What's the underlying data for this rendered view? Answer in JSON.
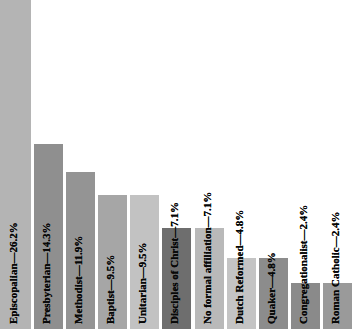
{
  "figure": {
    "background_color": "#ffffff",
    "label_color": "#080808"
  },
  "chart_data": {
    "type": "bar",
    "title": "",
    "subtitle": "",
    "xlabel": "",
    "ylabel": "",
    "grid": false,
    "legend": "none",
    "orientation": "vertical",
    "value_unit": "%",
    "ylim": [
      0,
      28
    ],
    "note": "Bar labels are rotated 90 degrees and drawn inside/above each bar; the tallest bar (Episcopalian) is clipped by the top of the image.",
    "categories": [
      "Episcopalian",
      "Presbyterian",
      "Methodist",
      "Baptist",
      "Unitarian",
      "Disciples of Christ",
      "No formal affiliation",
      "Dutch Reformed",
      "Quaker",
      "Congregationalist",
      "Roman Catholic"
    ],
    "values": [
      26.2,
      14.3,
      11.9,
      9.5,
      9.5,
      7.1,
      7.1,
      4.8,
      4.8,
      2.4,
      2.4
    ],
    "tick_labels": [
      "Episcopalian—26.2%",
      "Presbyterian—14.3%",
      "Methodist—11.9%",
      "Baptist—9.5%",
      "Unitarian—9.5%",
      "Disciples of Christ—7.1%",
      "No formal affiliation—7.1%",
      "Dutch Reformed—4.8%",
      "Quaker—4.8%",
      "Congregationalist—2.4%",
      "Roman Catholic—2.4%"
    ],
    "bar_colors": [
      "#b4b4b4",
      "#8f8f8f",
      "#949494",
      "#a6a6a6",
      "#c2c2c2",
      "#6e6e6e",
      "#b9b9b9",
      "#c4c4c4",
      "#8c8c8c",
      "#8a8a8a",
      "#9a9a9a"
    ],
    "bars": [
      {
        "label": "Episcopalian—26.2%",
        "category": "Episcopalian",
        "value": 26.2,
        "color": "#b4b4b4",
        "left_px": 0,
        "width_px": 28,
        "top_px": 0,
        "height_px": 329
      },
      {
        "label": "Presbyterian—14.3%",
        "category": "Presbyterian",
        "value": 14.3,
        "color": "#8f8f8f",
        "left_px": 32,
        "width_px": 33,
        "top_px": 144,
        "height_px": 185
      },
      {
        "label": "Methodist—11.9%",
        "category": "Methodist",
        "value": 11.9,
        "color": "#949494",
        "left_px": 68,
        "width_px": 33,
        "top_px": 172,
        "height_px": 157
      },
      {
        "label": "Baptist—9.5%",
        "category": "Baptist",
        "value": 9.5,
        "color": "#a6a6a6",
        "left_px": 104,
        "width_px": 33,
        "top_px": 195,
        "height_px": 134
      },
      {
        "label": "Unitarian—9.5%",
        "category": "Unitarian",
        "value": 9.5,
        "color": "#c2c2c2",
        "left_px": 140,
        "width_px": 33,
        "top_px": 195,
        "height_px": 134
      },
      {
        "label": "Disciples of Christ—7.1%",
        "category": "Disciples of Christ",
        "value": 7.1,
        "color": "#6e6e6e",
        "left_px": 176,
        "width_px": 33,
        "top_px": 228,
        "height_px": 101
      },
      {
        "label": "No formal affiliation—7.1%",
        "category": "No formal affiliation",
        "value": 7.1,
        "color": "#b9b9b9",
        "left_px": 212,
        "width_px": 33,
        "top_px": 228,
        "height_px": 101
      },
      {
        "label": "Dutch Reformed—4.8%",
        "category": "Dutch Reformed",
        "value": 4.8,
        "color": "#c4c4c4",
        "left_px": 248,
        "width_px": 33,
        "top_px": 258,
        "height_px": 71
      },
      {
        "label": "Quaker—4.8%",
        "category": "Quaker",
        "value": 4.8,
        "color": "#8c8c8c",
        "left_px": 284,
        "width_px": 33,
        "top_px": 258,
        "height_px": 71
      },
      {
        "label": "Congregationalist—2.4%",
        "category": "Congregationalist",
        "value": 2.4,
        "color": "#8a8a8a",
        "left_px": 283,
        "width_px": 33,
        "top_px": 283,
        "height_px": 46
      },
      {
        "label": "Roman Catholic—2.4%",
        "category": "Roman Catholic",
        "value": 2.4,
        "color": "#9a9a9a",
        "left_px": 320,
        "width_px": 33,
        "top_px": 283,
        "height_px": 46
      }
    ]
  }
}
